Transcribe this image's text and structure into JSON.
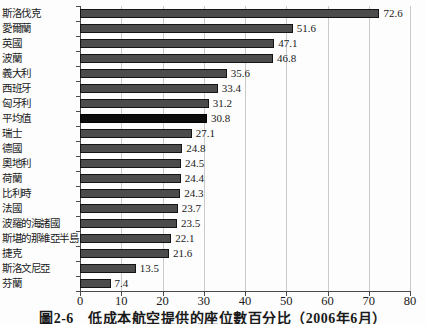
{
  "figure": {
    "caption": "圖2-6　低成本航空提供的座位數百分比（2006年6月）"
  },
  "chart_data": {
    "type": "bar",
    "orientation": "horizontal",
    "title": "",
    "xlabel": "",
    "ylabel": "",
    "xlim": [
      0,
      80
    ],
    "x_ticks": [
      0,
      10,
      20,
      30,
      40,
      50,
      60,
      70,
      80
    ],
    "grid": true,
    "legend": false,
    "value_labels": true,
    "categories": [
      "斯洛伐克",
      "愛爾蘭",
      "英國",
      "波蘭",
      "義大利",
      "西班牙",
      "匈牙利",
      "平均值",
      "瑞士",
      "德國",
      "奧地利",
      "荷蘭",
      "比利時",
      "法國",
      "波羅的海諸國",
      "斯堪的那維亞半島",
      "捷克",
      "斯洛文尼亞",
      "芬蘭"
    ],
    "values": [
      72.6,
      51.6,
      47.1,
      46.8,
      35.6,
      33.4,
      31.2,
      30.8,
      27.1,
      24.8,
      24.5,
      24.4,
      24.3,
      23.7,
      23.5,
      22.1,
      21.6,
      13.5,
      7.4
    ],
    "highlight_category": "平均值"
  },
  "colors": {
    "background": "#fdfdfd",
    "bar": "#4c4c4c",
    "bar_border": "#141414",
    "highlight_bar": "#0d0d0d",
    "gridline": "#cacaca",
    "axis": "#4a4a4a",
    "text": "#1a1a1a"
  }
}
